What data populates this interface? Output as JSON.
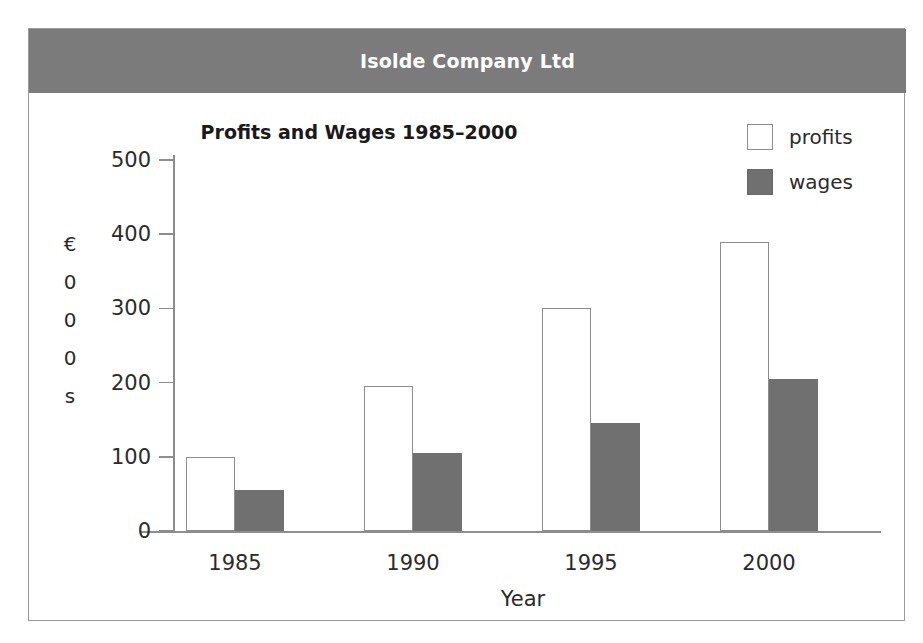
{
  "banner": {
    "title": "Isolde Company Ltd",
    "background_color": "#7b7b7b",
    "text_color": "#ffffff"
  },
  "chart_data": {
    "type": "bar",
    "title": "Profits and Wages 1985–2000",
    "xlabel": "Year",
    "ylabel": "€000s",
    "ylabel_stacked": [
      "€",
      "0",
      "0",
      "0",
      "s"
    ],
    "categories": [
      "1985",
      "1990",
      "1995",
      "2000"
    ],
    "series": [
      {
        "name": "profits",
        "values": [
          100,
          195,
          300,
          390
        ],
        "fill_color": "#ffffff",
        "border_color": "#8d8d8d"
      },
      {
        "name": "wages",
        "values": [
          55,
          105,
          145,
          205
        ],
        "fill_color": "#707070",
        "border_color": "#707070"
      }
    ],
    "ylim": [
      0,
      500
    ],
    "ytick_labels": [
      "500",
      "400",
      "300",
      "200",
      "100",
      "0"
    ],
    "ytick_values": [
      500,
      400,
      300,
      200,
      100,
      0
    ],
    "grid": false,
    "legend_position": "top-right"
  },
  "legend": {
    "items": [
      {
        "label": "profits"
      },
      {
        "label": "wages"
      }
    ]
  }
}
